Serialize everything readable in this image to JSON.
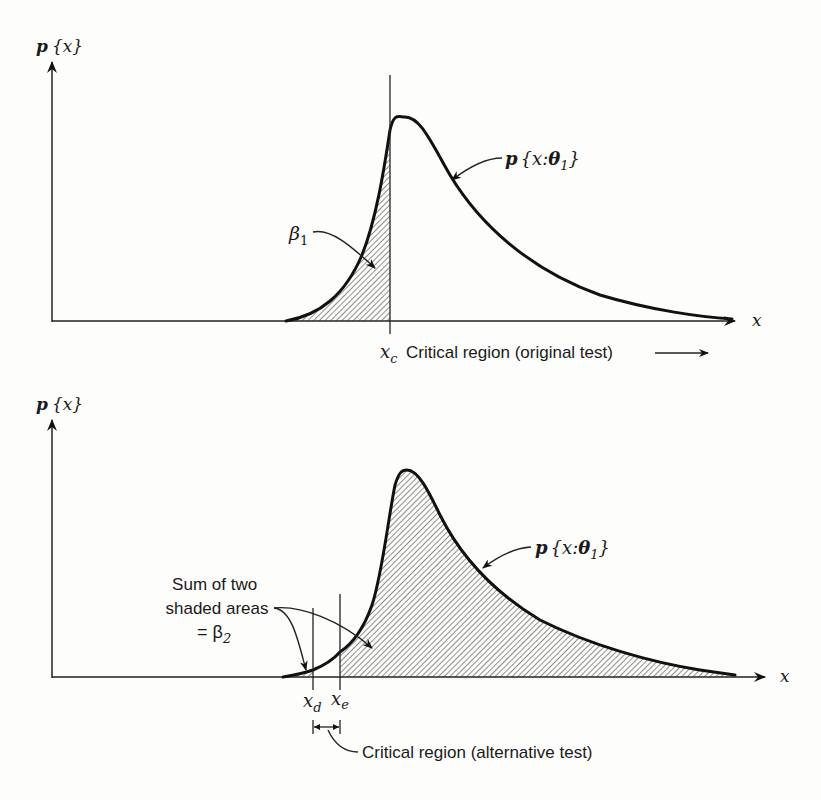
{
  "top_panel": {
    "y_axis_label_p": "p",
    "y_axis_label_x": "x",
    "x_axis_label": "x",
    "curve_label": "p{x:θ₁}",
    "curve_label_parts": {
      "p": "p",
      "open": "{",
      "var": "x:",
      "theta": "θ",
      "sub": "1",
      "close": "}"
    },
    "beta_label": {
      "symbol": "β",
      "sub": "1"
    },
    "critical_value": {
      "symbol": "x",
      "sub": "c"
    },
    "critical_region_text": "Critical region (original test)"
  },
  "bottom_panel": {
    "y_axis_label_p": "p",
    "y_axis_label_x": "x",
    "x_axis_label": "x",
    "curve_label_parts": {
      "p": "p",
      "open": "{",
      "var": "x:",
      "theta": "θ",
      "sub": "1",
      "close": "}"
    },
    "annotation_lines": [
      "Sum of two",
      "shaded areas",
      "= β"
    ],
    "annotation_sub": "2",
    "xd": {
      "symbol": "x",
      "sub": "d"
    },
    "xe": {
      "symbol": "x",
      "sub": "e"
    },
    "critical_region_text": "Critical region (alternative test)"
  },
  "colors": {
    "ink": "#111111",
    "paper": "#fdfdfb"
  }
}
